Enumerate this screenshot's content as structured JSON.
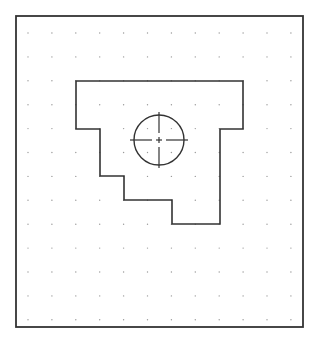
{
  "drawing": {
    "frame": {
      "x": 16,
      "y": 16,
      "width": 287,
      "height": 311,
      "stroke": "#333333",
      "stroke_width": 1.8
    },
    "grid": {
      "x_start": 28,
      "y_start": 33,
      "step_x": 23.9,
      "step_y": 23.9,
      "cols": 12,
      "rows": 13,
      "dot_color": "#9a9a9a",
      "dot_radius": 0.7
    },
    "outline": {
      "stroke": "#333333",
      "stroke_width": 1.6,
      "points": [
        [
          76,
          81
        ],
        [
          243,
          81
        ],
        [
          243,
          129
        ],
        [
          220,
          129
        ],
        [
          220,
          224
        ],
        [
          172,
          224
        ],
        [
          172,
          200
        ],
        [
          124,
          200
        ],
        [
          124,
          176
        ],
        [
          100,
          176
        ],
        [
          100,
          129
        ],
        [
          76,
          129
        ]
      ]
    },
    "hole": {
      "cx": 159,
      "cy": 140,
      "r": 25,
      "stroke": "#333333",
      "stroke_width": 1.4
    },
    "centerlines": {
      "stroke": "#333333",
      "stroke_width": 1.2,
      "horizontal": {
        "x1": 130,
        "x2": 188,
        "y": 140
      },
      "vertical": {
        "x": 159,
        "y1": 112,
        "y2": 168
      },
      "gap": 4,
      "center_tick": 3
    }
  }
}
